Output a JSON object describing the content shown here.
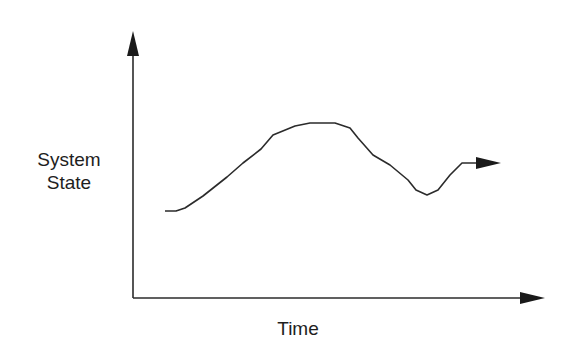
{
  "diagram": {
    "y_axis_label_line1": "System",
    "y_axis_label_line2": "State",
    "x_axis_label": "Time",
    "colors": {
      "line": "#2b2b2b",
      "background": "#ffffff",
      "text": "#1e1e1e"
    },
    "curve_points": [
      [
        165,
        211
      ],
      [
        176,
        211
      ],
      [
        185,
        208
      ],
      [
        203,
        196
      ],
      [
        227,
        177
      ],
      [
        243,
        163
      ],
      [
        261,
        149
      ],
      [
        273,
        135
      ],
      [
        295,
        126
      ],
      [
        310,
        123
      ],
      [
        335,
        123
      ],
      [
        350,
        128
      ],
      [
        358,
        138
      ],
      [
        373,
        155
      ],
      [
        390,
        165
      ],
      [
        408,
        180
      ],
      [
        416,
        190
      ],
      [
        427,
        195
      ],
      [
        438,
        190
      ],
      [
        450,
        175
      ],
      [
        462,
        163
      ],
      [
        478,
        163
      ]
    ],
    "curve_description": "System state trajectory over time: starts low, rises to a peak, dips, then recovers and continues right (arrow)"
  }
}
